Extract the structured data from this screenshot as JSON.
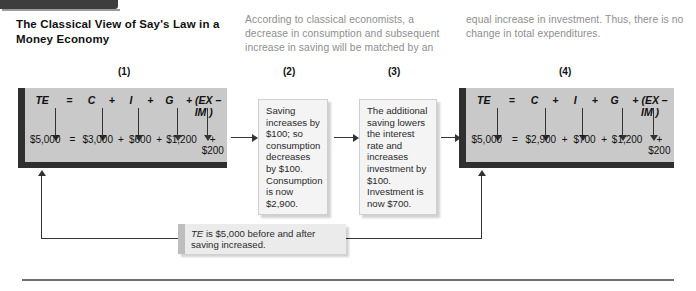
{
  "figure": {
    "title": "The Classical View of Say's Law in a Money Economy",
    "caption_left": "According to classical economists, a decrease in consumption and subsequent increase in saving will be matched by an",
    "caption_right": "equal increase in investment. Thus, there is no change in total expenditures.",
    "footer_callout": "TE is $5,000 before and after saving increased.",
    "footer_callout_emphasis": "TE"
  },
  "steps": {
    "labels": [
      "(1)",
      "(2)",
      "(3)",
      "(4)"
    ]
  },
  "equation_box_1": {
    "symbols": [
      "TE",
      "=",
      "C",
      "+",
      "I",
      "+",
      "G",
      "+ (EX – IM )"
    ],
    "values": [
      "$5,000",
      "=",
      "$3,000",
      "+",
      "$600",
      "+",
      "$1,200",
      "+ $200"
    ]
  },
  "equation_box_4": {
    "symbols": [
      "TE",
      "=",
      "C",
      "+",
      "I",
      "+",
      "G",
      "+ (EX – IM )"
    ],
    "values": [
      "$5,000",
      "=",
      "$2,900",
      "+",
      "$700",
      "+",
      "$1,200",
      "+ $200"
    ]
  },
  "text_box_2": {
    "body": "Saving increases by $100; so consumption decreases by $100. Consumption is now $2,900."
  },
  "text_box_3": {
    "body": "The additional saving lowers the interest rate and increases investment by $100. Investment is now $700."
  },
  "colors": {
    "equation_box_fill": "#c9c9c9",
    "equation_box_edge": "#2f2f2f",
    "text_box_fill": "#f4f4f4",
    "callout_fill": "#ebebeb",
    "caption_text": "#8e8e8e",
    "arrow": "#333333"
  }
}
